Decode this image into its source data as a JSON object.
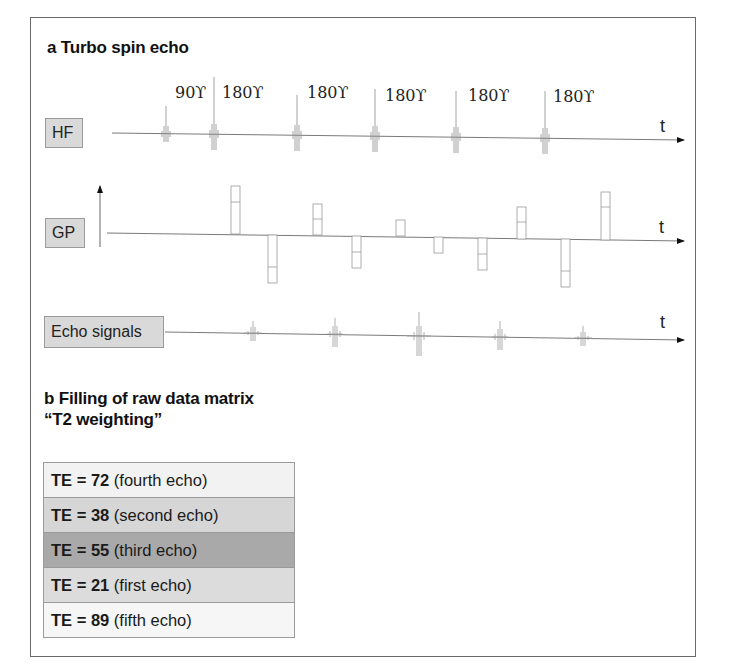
{
  "section_a": {
    "title": "a Turbo spin echo",
    "rows": {
      "hf": {
        "label": "HF"
      },
      "gp": {
        "label": "GP"
      },
      "echo": {
        "label": "Echo signals"
      }
    },
    "time_axis_label": "t",
    "pulses": [
      {
        "label": "90ϒ",
        "x": 166
      },
      {
        "label": "180ϒ",
        "x": 214
      },
      {
        "label": "180ϒ",
        "x": 297
      },
      {
        "label": "180ϒ",
        "x": 375
      },
      {
        "label": "180ϒ",
        "x": 456
      },
      {
        "label": "180ϒ",
        "x": 545
      }
    ],
    "gradient_lobes": [
      {
        "x": 231,
        "direction": "up",
        "height": 48,
        "mark": 16
      },
      {
        "x": 268,
        "direction": "down",
        "height": 48,
        "mark": 32
      },
      {
        "x": 313,
        "direction": "up",
        "height": 30,
        "mark": 15
      },
      {
        "x": 352,
        "direction": "down",
        "height": 32,
        "mark": 16
      },
      {
        "x": 396,
        "direction": "up",
        "height": 16,
        "mark": 0
      },
      {
        "x": 434,
        "direction": "down",
        "height": 16,
        "mark": 0
      },
      {
        "x": 478,
        "direction": "down",
        "height": 32,
        "mark": 16
      },
      {
        "x": 517,
        "direction": "up",
        "height": 32,
        "mark": 16
      },
      {
        "x": 561,
        "direction": "down",
        "height": 48,
        "mark": 32
      },
      {
        "x": 601,
        "direction": "up",
        "height": 48,
        "mark": 16
      }
    ],
    "echoes": [
      {
        "x": 253,
        "amplitude": 12
      },
      {
        "x": 335,
        "amplitude": 16
      },
      {
        "x": 419,
        "amplitude": 24
      },
      {
        "x": 500,
        "amplitude": 16
      },
      {
        "x": 583,
        "amplitude": 12
      }
    ]
  },
  "section_b": {
    "title_line1": "b Filling of raw data matrix",
    "title_line2": "“T2 weighting”",
    "rows": [
      {
        "prefix": "TE = ",
        "value": "72",
        "note": " (fourth echo)",
        "color": "#f2f2f2"
      },
      {
        "prefix": "TE = ",
        "value": "38",
        "note": " (second echo)",
        "color": "#d6d6d6"
      },
      {
        "prefix": "TE = ",
        "value": "55",
        "note": " (third echo)",
        "color": "#a9a9a9"
      },
      {
        "prefix": "TE = ",
        "value": "21",
        "note": " (first echo)",
        "color": "#dcdcdc"
      },
      {
        "prefix": "TE = ",
        "value": "89",
        "note": " (fifth echo)",
        "color": "#f6f6f6"
      }
    ]
  },
  "colors": {
    "frame": "#6a6a6a",
    "line": "#7a7a7a",
    "label_fill": "#d9d9d9"
  }
}
